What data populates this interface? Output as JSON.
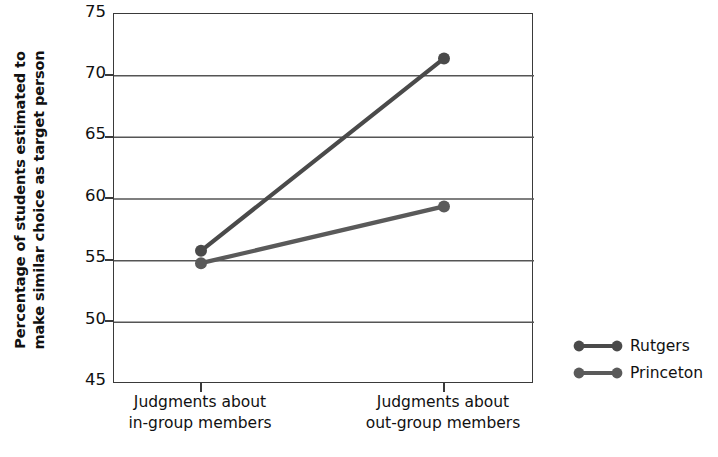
{
  "chart_data": {
    "type": "line",
    "title": "",
    "xlabel": "",
    "ylabel": "Percentage of students estimated to make similar choice as target person",
    "ylabel_lines": [
      "Percentage of students estimated to",
      "make similar choice as target person"
    ],
    "categories": [
      "Judgments about in-group members",
      "Judgments about out-group members"
    ],
    "category_lines": [
      [
        "Judgments about",
        "in-group members"
      ],
      [
        "Judgments about",
        "out-group members"
      ]
    ],
    "series": [
      {
        "name": "Rutgers",
        "values": [
          55.8,
          71.4
        ],
        "color": "#4a4a4a"
      },
      {
        "name": "Princeton",
        "values": [
          54.8,
          59.4
        ],
        "color": "#5a5a5a"
      }
    ],
    "ylim": [
      45,
      75
    ],
    "yticks": [
      75,
      70,
      65,
      60,
      55,
      50,
      45
    ],
    "ytick_labels": [
      "75",
      "70",
      "65",
      "60",
      "55",
      "50",
      "45"
    ],
    "grid": true,
    "grid_color": "#555555",
    "legend_position": "right-outside",
    "legend_entries": [
      "Rutgers",
      "Princeton"
    ]
  },
  "axis": {
    "y_title_line1": "Percentage of students estimated to",
    "y_title_line2": "make similar choice as target person",
    "ytick_0": "75",
    "ytick_1": "70",
    "ytick_2": "65",
    "ytick_3": "60",
    "ytick_4": "55",
    "ytick_5": "50",
    "ytick_6": "45"
  },
  "xcats": {
    "cat0_line1": "Judgments about",
    "cat0_line2": "in-group members",
    "cat1_line1": "Judgments about",
    "cat1_line2": "out-group members"
  },
  "legend": {
    "item0": "Rutgers",
    "item1": "Princeton"
  },
  "colors": {
    "series_rutgers": "#4a4a4a",
    "series_princeton": "#5a5a5a",
    "axis": "#3a3a3a",
    "gridline": "#555555",
    "background": "#ffffff",
    "text": "#111111"
  }
}
